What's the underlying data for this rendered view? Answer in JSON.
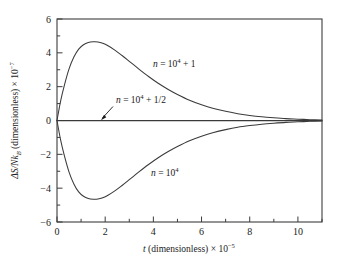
{
  "chart_data": {
    "type": "line",
    "title": "",
    "xlabel": "t (dimensionless) × 10⁻⁵",
    "ylabel": "ΔS/Nk_B (dimensionless) × 10⁻⁷",
    "xlim": [
      0,
      11
    ],
    "ylim": [
      -6,
      6
    ],
    "grid": false,
    "legend_position": "inline-annotations",
    "x_major_ticks": [
      0,
      2,
      4,
      6,
      8,
      10
    ],
    "x_minor_ticks": [
      1,
      3,
      5,
      7,
      9,
      11
    ],
    "y_major_ticks": [
      6,
      4,
      2,
      0,
      -2,
      -4,
      -6
    ],
    "y_minor_ticks": [
      5,
      3,
      1,
      -1,
      -3,
      -5
    ],
    "x_tick_labels": [
      "0",
      "2",
      "4",
      "6",
      "8",
      "10"
    ],
    "y_tick_labels": [
      "6",
      "4",
      "2",
      "0",
      "-2",
      "-4",
      "-6"
    ],
    "series": [
      {
        "name": "n = 10^4 + 1",
        "peak_value": 4.65,
        "peak_x": 1.7,
        "x": [
          0,
          0.15,
          0.3,
          0.5,
          0.7,
          0.9,
          1.1,
          1.3,
          1.5,
          1.7,
          1.9,
          2.1,
          2.4,
          2.7,
          3.0,
          3.4,
          3.8,
          4.2,
          4.6,
          5.0,
          5.5,
          6.0,
          6.5,
          7.0,
          7.5,
          8.0,
          8.5,
          9.0,
          9.5,
          10.0,
          10.5,
          11.0
        ],
        "values": [
          0,
          1.15,
          2.05,
          3.05,
          3.75,
          4.22,
          4.48,
          4.61,
          4.65,
          4.64,
          4.56,
          4.43,
          4.16,
          3.84,
          3.5,
          3.04,
          2.6,
          2.2,
          1.85,
          1.54,
          1.2,
          0.93,
          0.71,
          0.54,
          0.4,
          0.3,
          0.22,
          0.16,
          0.11,
          0.08,
          0.05,
          0.03
        ]
      },
      {
        "name": "n = 10^4 + 1/2",
        "peak_value": 0,
        "peak_x": 0,
        "x": [
          0,
          1,
          2,
          3,
          4,
          5,
          6,
          7,
          8,
          9,
          10,
          11
        ],
        "values": [
          0,
          0,
          0,
          0,
          0,
          0,
          0,
          0,
          0,
          0,
          0,
          0
        ]
      },
      {
        "name": "n = 10^4",
        "peak_value": -4.65,
        "peak_x": 1.7,
        "x": [
          0,
          0.15,
          0.3,
          0.5,
          0.7,
          0.9,
          1.1,
          1.3,
          1.5,
          1.7,
          1.9,
          2.1,
          2.4,
          2.7,
          3.0,
          3.4,
          3.8,
          4.2,
          4.6,
          5.0,
          5.5,
          6.0,
          6.5,
          7.0,
          7.5,
          8.0,
          8.5,
          9.0,
          9.5,
          10.0,
          10.5,
          11.0
        ],
        "values": [
          0,
          -1.15,
          -2.05,
          -3.05,
          -3.75,
          -4.22,
          -4.48,
          -4.61,
          -4.65,
          -4.64,
          -4.56,
          -4.43,
          -4.16,
          -3.84,
          -3.5,
          -3.04,
          -2.6,
          -2.2,
          -1.85,
          -1.54,
          -1.2,
          -0.93,
          -0.71,
          -0.54,
          -0.4,
          -0.3,
          -0.22,
          -0.16,
          -0.11,
          -0.08,
          -0.05,
          -0.03
        ]
      }
    ],
    "annotations": [
      {
        "id": "upper",
        "prefix": "n",
        "equals": " = 10",
        "exponent": "4",
        "suffix": " + 1",
        "x": 4.0,
        "y": 3.05
      },
      {
        "id": "middle",
        "prefix": "n",
        "equals": " = 10",
        "exponent": "4",
        "suffix": " + 1/2",
        "x": 2.35,
        "y": 0.95,
        "has_arrow": true
      },
      {
        "id": "lower",
        "prefix": "n",
        "equals": " = 10",
        "exponent": "4",
        "suffix": "",
        "x": 3.9,
        "y": -3.05
      }
    ],
    "ylabel_parts": {
      "delta_s": "ΔS/N",
      "k": "k",
      "k_sub": "B",
      "rest": " (dimensionless) × 10",
      "exp": "−7"
    },
    "xlabel_parts": {
      "t": "t",
      "rest": " (dimensionless) × 10",
      "exp": "−5"
    },
    "colors": {
      "axis": "#3c3c3c",
      "curve": "#3a3a3a",
      "text": "#1a1a1a",
      "background": "#ffffff"
    }
  }
}
